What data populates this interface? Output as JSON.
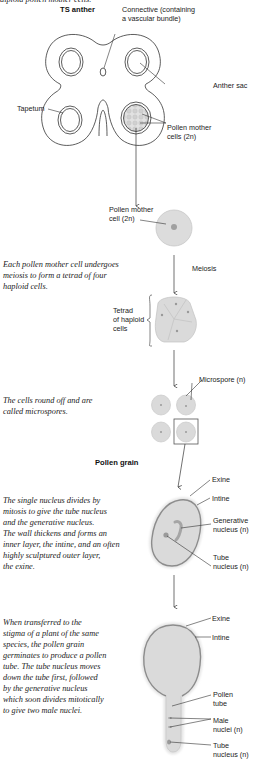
{
  "figure": {
    "top_caption_cut": "diploid pollen mother cells.",
    "sections": {
      "ts_anther": {
        "title": "TS anther",
        "labels": {
          "connective_line1": "Connective (containing",
          "connective_line2": "a vascular bundle)",
          "anther_sac": "Anther sac",
          "tapetum": "Tapetum",
          "pollen_mother_cells_line1": "Pollen mother",
          "pollen_mother_cells_line2": "cells (2n)"
        }
      },
      "pollen_mother_cell": {
        "label_line1": "Pollen mother",
        "label_line2": "cell (2n)"
      },
      "meiosis": {
        "arrow_label": "Meiosis",
        "caption": [
          "Each pollen mother cell undergoes",
          "meiosis to form a tetrad of four",
          "haploid cells."
        ],
        "tetrad_label": [
          "Tetrad",
          "of haploid",
          "cells"
        ]
      },
      "microspores": {
        "label": "Microspore (n)",
        "caption": [
          "The cells round off and are",
          "called microspores."
        ]
      },
      "pollen_grain": {
        "title": "Pollen grain",
        "caption": [
          "The single nucleus divides by",
          "mitosis to give the tube nucleus",
          "and the generative nucleus.",
          "The wall thickens and forms an",
          "inner layer, the intine, and an often",
          "highly sculptured outer layer,",
          "the exine."
        ],
        "labels": {
          "exine": "Exine",
          "intine": "Intine",
          "generative_line1": "Generative",
          "generative_line2": "nucleus (n)",
          "tube_line1": "Tube",
          "tube_line2": "nucleus (n)"
        }
      },
      "germination": {
        "caption": [
          "When transferred to the",
          "stigma of a plant of the same",
          "species, the pollen grain",
          "germinates to produce a pollen",
          "tube.  The tube nucleus moves",
          "down the tube first, followed",
          "by the generative nucleus",
          "which soon divides mitotically",
          "to give two male nuclei."
        ],
        "labels": {
          "exine": "Exine",
          "intine": "Intine",
          "pollen_tube_line1": "Pollen",
          "pollen_tube_line2": "tube",
          "male_line1": "Male",
          "male_line2": "nuclei (n)",
          "tube_line1": "Tube",
          "tube_line2": "nucleus (n)"
        }
      }
    },
    "colors": {
      "line": "#333333",
      "cell_fill": "#d9d9d9",
      "cell_stroke": "#c4c4c4",
      "nucleus": "#9a9a9a",
      "wall": "#8c8c8c",
      "text": "#222222"
    }
  }
}
